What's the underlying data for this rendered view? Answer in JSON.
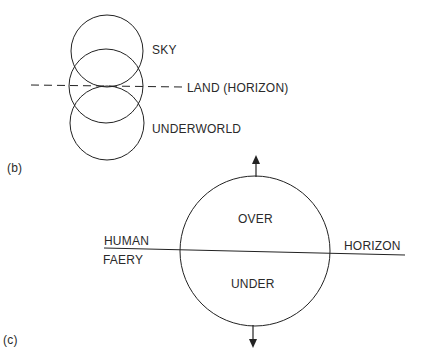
{
  "figure_b": {
    "panel_label": "(b)",
    "labels": {
      "sky": "SKY",
      "land": "LAND (HORIZON)",
      "underworld": "UNDERWORLD"
    }
  },
  "figure_c": {
    "panel_label": "(c)",
    "labels": {
      "over": "OVER",
      "under": "UNDER",
      "human": "HUMAN",
      "faery": "FAERY",
      "horizon": "HORIZON"
    }
  },
  "colors": {
    "stroke": "#222222",
    "text": "#2a2a2a",
    "background": "#ffffff"
  }
}
